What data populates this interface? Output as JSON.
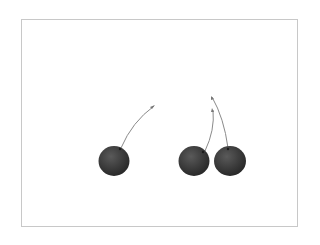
{
  "image": {
    "subject": "three dark cherries with stems on white background",
    "colors": {
      "background": "#ffffff",
      "frame_border": "#c8c8c8",
      "cherry_dark": "#2e2e2e",
      "cherry_mid": "#555555",
      "stem": "#8a8a8a"
    },
    "objects": [
      {
        "name": "cherry-left",
        "cx": 114,
        "cy": 161,
        "r": 15,
        "stem": "M121,148 Q132,122 154,106"
      },
      {
        "name": "cherry-middle",
        "cx": 194,
        "cy": 161,
        "r": 15,
        "stem": "M205,151 Q215,130 213,110"
      },
      {
        "name": "cherry-right",
        "cx": 229,
        "cy": 161,
        "r": 15.5,
        "stem": "M228,148 Q224,118 212,97"
      }
    ]
  }
}
